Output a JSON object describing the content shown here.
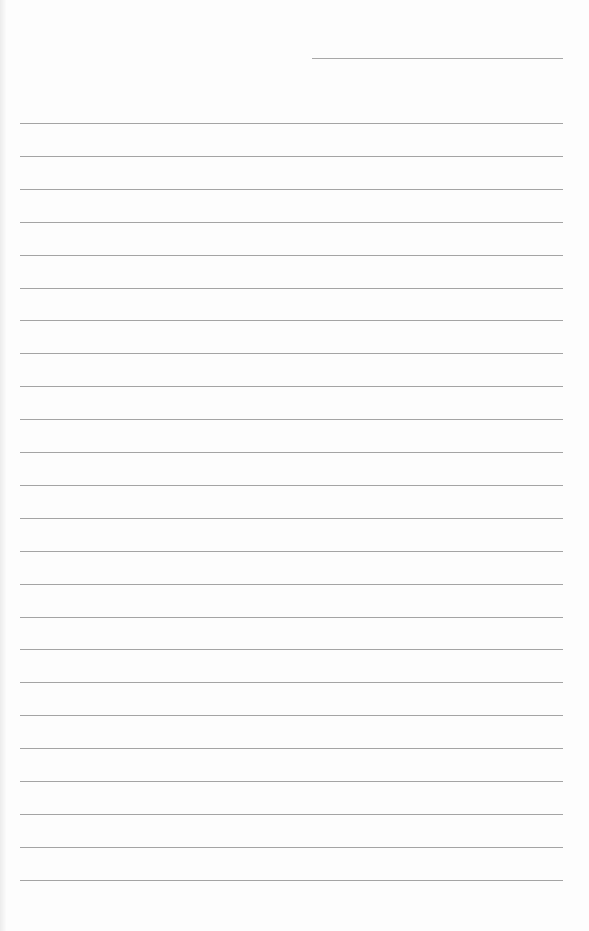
{
  "document": {
    "type": "lined-writing-paper",
    "header_line": {
      "x": 312,
      "y": 58,
      "width": 251
    },
    "rules": {
      "x": 20,
      "width": 543,
      "first_y": 123,
      "spacing": 32.9,
      "count": 24
    },
    "colors": {
      "paper": "#fdfdfd",
      "rule": "#a4a4a4",
      "edge": "#ececec"
    },
    "text": []
  }
}
